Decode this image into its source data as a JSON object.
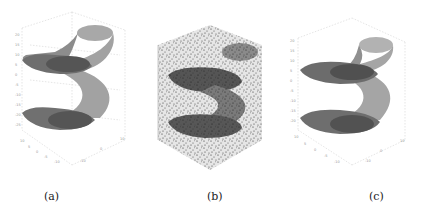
{
  "figure": {
    "panels": [
      {
        "id": "a",
        "caption": "(a)",
        "description": "3D helical (S-shaped) tube surface with dark end caps, clean"
      },
      {
        "id": "b",
        "caption": "(b)",
        "description": "Same helical shape overlaid with dense random scatter noise points"
      },
      {
        "id": "c",
        "caption": "(c)",
        "description": "Reconstructed helical tube surface with end caps"
      }
    ],
    "colors": {
      "surface": "#9a9a9a",
      "surface_light": "#b8b8b8",
      "cap": "#555555",
      "grid": "#cfcfcf",
      "noise": "#333333"
    }
  }
}
